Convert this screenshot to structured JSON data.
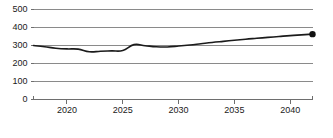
{
  "chart_data": {
    "type": "line",
    "title": "",
    "subtitle": "",
    "xlabel": "",
    "ylabel": "",
    "xlim": [
      2017,
      2042
    ],
    "ylim": [
      0,
      500
    ],
    "grid": true,
    "legend": false,
    "legend_position": "none",
    "y_ticks": [
      0,
      100,
      200,
      300,
      400,
      500
    ],
    "y_tick_labels": [
      "0",
      "100",
      "200",
      "300",
      "400",
      "500"
    ],
    "x_ticks": [
      2020,
      2025,
      2030,
      2035,
      2040
    ],
    "x_tick_labels": [
      "2020",
      "2025",
      "2030",
      "2035",
      "2040"
    ],
    "series": [
      {
        "name": "series-1",
        "color": "#1b1b1b",
        "endpoint_marker": true,
        "x": [
          2017,
          2018,
          2019,
          2020,
          2021,
          2022,
          2023,
          2024,
          2025,
          2026,
          2027,
          2028,
          2029,
          2030,
          2031,
          2032,
          2033,
          2034,
          2035,
          2036,
          2037,
          2038,
          2039,
          2040,
          2041,
          2042
        ],
        "values": [
          300,
          293,
          285,
          281,
          280,
          265,
          268,
          270,
          272,
          305,
          299,
          293,
          292,
          297,
          303,
          310,
          317,
          323,
          329,
          335,
          340,
          345,
          350,
          355,
          359,
          363
        ]
      }
    ],
    "annotations": []
  },
  "axis_colors": {
    "gridline": "#8a8a8a",
    "baseline": "#6e6e6e",
    "tick": "#6e6e6e",
    "label": "#1a1a1a"
  }
}
